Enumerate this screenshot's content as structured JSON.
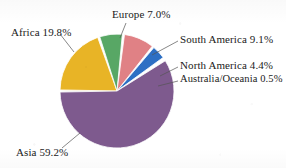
{
  "figure": {
    "background_color": "#ffffff",
    "title_remnant": "",
    "label_color": "#1a1a1a"
  },
  "geometry": {
    "center_x": 117,
    "center_y": 91,
    "radius": 57,
    "start_angle_deg": 180,
    "direction": "clockwise",
    "gap_deg": 2.2
  },
  "chart_data": {
    "type": "pie",
    "title": "",
    "xlabel": "",
    "ylabel": "",
    "legend_position": "none",
    "labels_outside": true,
    "leader_lines": true,
    "units": "percent",
    "total": 100.0,
    "categories": [
      "Africa",
      "Europe",
      "South America",
      "North America",
      "Australia/Oceania",
      "Asia"
    ],
    "values": [
      19.8,
      7.0,
      9.1,
      4.4,
      0.5,
      59.2
    ],
    "colors": [
      "#E8B426",
      "#58A765",
      "#E08185",
      "#2D6FC4",
      "#F4F4F4",
      "#7E5A8E"
    ],
    "slices": [
      {
        "name": "Africa",
        "value": 19.8,
        "label": "Africa 19.8%",
        "color": "#E8B426"
      },
      {
        "name": "Europe",
        "value": 7.0,
        "label": "Europe 7.0%",
        "color": "#58A765"
      },
      {
        "name": "South America",
        "value": 9.1,
        "label": "South America 9.1%",
        "color": "#E08185"
      },
      {
        "name": "North America",
        "value": 4.4,
        "label": "North America 4.4%",
        "color": "#2D6FC4"
      },
      {
        "name": "Australia/Oceania",
        "value": 0.5,
        "label": "Australia/Oceania 0.5%",
        "color": "#F4F4F4"
      },
      {
        "name": "Asia",
        "value": 59.2,
        "label": "Asia 59.2%",
        "color": "#7E5A8E"
      }
    ]
  },
  "labels": {
    "africa": "Africa 19.8%",
    "europe": "Europe 7.0%",
    "south_america": "South America 9.1%",
    "north_america": "North America 4.4%",
    "australia_oceania": "Australia/Oceania 0.5%",
    "asia": "Asia 59.2%"
  }
}
